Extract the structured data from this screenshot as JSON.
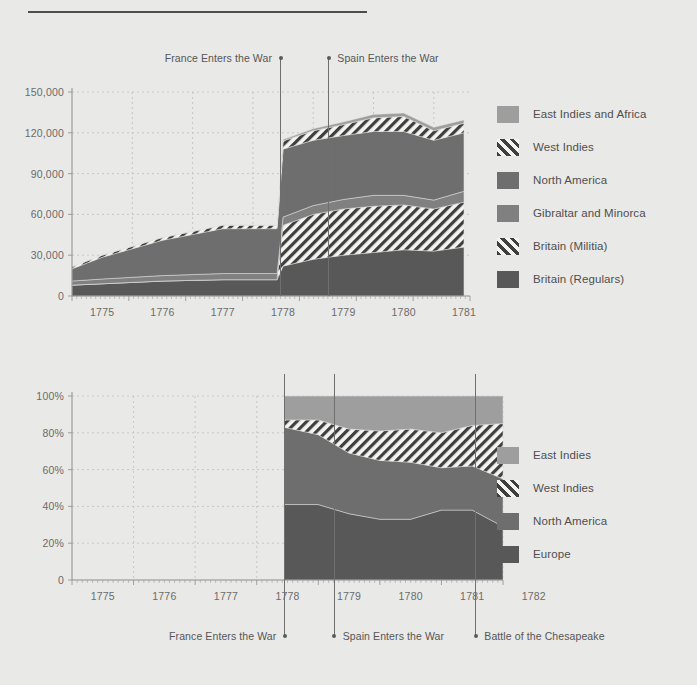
{
  "page": {
    "background_color": "#e9e9e7",
    "title_rule_visible": true
  },
  "palette": {
    "east_indies": "#9e9e9e",
    "west_indies_hatch_bg": "#f2f2f0",
    "west_indies_hatch_line": "#3f3f3f",
    "north_america": "#6e6e6e",
    "gibraltar": "#808080",
    "britain_militia_bg": "#f2f2f0",
    "britain_regulars": "#585858",
    "europe": "#585858",
    "axis": "#8d8d8d",
    "grid": "#bfbfbf",
    "text": "#4f4f4f"
  },
  "top_chart": {
    "y_ticks": [
      "0",
      "30,000",
      "60,000",
      "90,000",
      "120,000",
      "150,000"
    ],
    "y_tick_values": [
      0,
      30000,
      60000,
      90000,
      120000,
      150000
    ],
    "x_ticks": [
      "1775",
      "1776",
      "1777",
      "1778",
      "1779",
      "1780",
      "1781"
    ],
    "annotations": [
      {
        "label": "France Enters the War",
        "year": 1778.45,
        "align": "left"
      },
      {
        "label": "Spain Enters the War",
        "year": 1779.25,
        "align": "right"
      }
    ],
    "legend": [
      {
        "label": "East Indies and Africa",
        "style": "solid",
        "color": "#9e9e9e"
      },
      {
        "label": "West Indies",
        "style": "hatch",
        "color": "#f2f2f0"
      },
      {
        "label": "North America",
        "style": "solid",
        "color": "#6e6e6e"
      },
      {
        "label": "Gibraltar and Minorca",
        "style": "solid",
        "color": "#808080"
      },
      {
        "label": "Britain (Militia)",
        "style": "hatch",
        "color": "#f2f2f0"
      },
      {
        "label": "Britain (Regulars)",
        "style": "solid",
        "color": "#585858"
      }
    ]
  },
  "bottom_chart": {
    "y_ticks": [
      "0",
      "20%",
      "40%",
      "60%",
      "80%",
      "100%"
    ],
    "y_tick_values": [
      0,
      20,
      40,
      60,
      80,
      100
    ],
    "x_ticks": [
      "1775",
      "1776",
      "1777",
      "1778",
      "1779",
      "1780",
      "1781",
      "1782"
    ],
    "annotations": [
      {
        "label": "France Enters the War",
        "year": 1778.45,
        "align": "left"
      },
      {
        "label": "Spain Enters the War",
        "year": 1779.25,
        "align": "right"
      },
      {
        "label": "Battle of the Chesapeake",
        "year": 1781.55,
        "align": "right"
      }
    ],
    "legend": [
      {
        "label": "East Indies",
        "style": "solid",
        "color": "#9e9e9e"
      },
      {
        "label": "West Indies",
        "style": "hatch",
        "color": "#f2f2f0"
      },
      {
        "label": "North America",
        "style": "solid",
        "color": "#6e6e6e"
      },
      {
        "label": "Europe",
        "style": "solid",
        "color": "#585858"
      }
    ]
  },
  "chart_data": [
    {
      "type": "area",
      "id": "british-forces-deployment-absolute",
      "title": "",
      "subtitle": "",
      "xlabel": "",
      "ylabel": "",
      "stacked": true,
      "grid": true,
      "legend_position": "right",
      "xlim": [
        1775,
        1781.6
      ],
      "ylim": [
        0,
        150000
      ],
      "x": [
        1775.0,
        1775.5,
        1776.5,
        1777.5,
        1778.4,
        1778.5,
        1779.0,
        1779.5,
        1780.0,
        1780.5,
        1781.0,
        1781.5
      ],
      "series": [
        {
          "name": "Britain (Regulars)",
          "style": "solid",
          "color": "#585858",
          "values": [
            8000,
            9000,
            11000,
            12000,
            12000,
            22000,
            27000,
            30000,
            32000,
            34000,
            33000,
            36000
          ]
        },
        {
          "name": "Britain (Militia)",
          "style": "hatch",
          "color": "#f2f2f0",
          "values": [
            0,
            0,
            0,
            0,
            0,
            30000,
            33000,
            34000,
            34000,
            33000,
            31000,
            33000
          ]
        },
        {
          "name": "Gibraltar and Minorca",
          "style": "solid",
          "color": "#808080",
          "values": [
            3000,
            3500,
            4000,
            4500,
            4500,
            6000,
            6500,
            7000,
            8000,
            7000,
            6500,
            8000
          ]
        },
        {
          "name": "North America",
          "style": "solid",
          "color": "#6e6e6e",
          "values": [
            9000,
            16000,
            26000,
            33000,
            33000,
            50000,
            48000,
            47000,
            47000,
            47000,
            44000,
            43000
          ]
        },
        {
          "name": "West Indies",
          "style": "hatch",
          "color": "#f2f2f0",
          "values": [
            1500,
            1500,
            2000,
            2500,
            2500,
            6000,
            7000,
            8000,
            10000,
            11000,
            7000,
            7000
          ]
        },
        {
          "name": "East Indies and Africa",
          "style": "solid",
          "color": "#9e9e9e",
          "values": [
            0,
            0,
            0,
            0,
            0,
            1000,
            1500,
            2000,
            2500,
            2500,
            2500,
            2500
          ]
        }
      ]
    },
    {
      "type": "area",
      "id": "british-forces-deployment-share",
      "title": "",
      "subtitle": "",
      "xlabel": "",
      "ylabel": "",
      "stacked": true,
      "normalized": true,
      "grid": true,
      "legend_position": "right",
      "xlim": [
        1775,
        1782.0
      ],
      "ylim": [
        0,
        100
      ],
      "x": [
        1778.45,
        1779.0,
        1779.5,
        1780.0,
        1780.5,
        1781.0,
        1781.5,
        1782.0
      ],
      "series": [
        {
          "name": "Europe",
          "style": "solid",
          "color": "#585858",
          "values": [
            41,
            41,
            36,
            33,
            33,
            38,
            38,
            29
          ]
        },
        {
          "name": "North America",
          "style": "solid",
          "color": "#6e6e6e",
          "values": [
            42,
            38,
            33,
            32,
            31,
            23,
            24,
            26
          ]
        },
        {
          "name": "West Indies",
          "style": "hatch",
          "color": "#f2f2f0",
          "values": [
            4,
            8,
            13,
            16,
            18,
            19,
            22,
            30
          ]
        },
        {
          "name": "East Indies",
          "style": "solid",
          "color": "#9e9e9e",
          "values": [
            13,
            13,
            18,
            19,
            18,
            20,
            16,
            15
          ]
        }
      ]
    }
  ]
}
